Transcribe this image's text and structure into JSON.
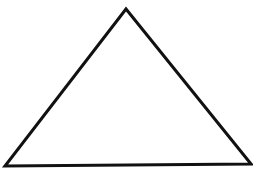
{
  "diagram": {
    "shape": "triangle",
    "stroke_color": "#111111",
    "fill_color": "#ffffff",
    "stroke_width": 3,
    "vertices": [
      [
        126,
        9
      ],
      [
        5,
        166
      ],
      [
        251,
        164
      ]
    ]
  }
}
